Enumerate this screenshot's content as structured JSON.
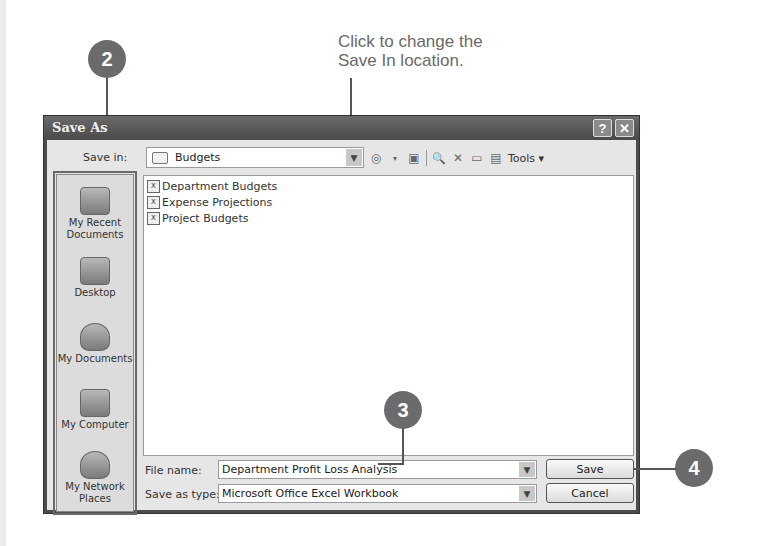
{
  "annotations": {
    "caption_line1": "Click to change the",
    "caption_line2": "Save In location.",
    "callouts": [
      "2",
      "3",
      "4"
    ]
  },
  "dialog": {
    "title": "Save As",
    "help_button": "?",
    "close_button": "✕",
    "save_in_label": "Save in:",
    "save_in_value": "Budgets",
    "toolbar": {
      "back_icon": "◎",
      "up_folder_icon": "▣",
      "search_web_icon": "🔍",
      "delete_icon": "✕",
      "new_folder_icon": "▭",
      "views_icon": "▤",
      "tools_label": "Tools ▾"
    },
    "places": [
      {
        "label_line1": "My Recent",
        "label_line2": "Documents"
      },
      {
        "label_line1": "Desktop",
        "label_line2": ""
      },
      {
        "label_line1": "My Documents",
        "label_line2": ""
      },
      {
        "label_line1": "My Computer",
        "label_line2": ""
      },
      {
        "label_line1": "My Network",
        "label_line2": "Places"
      }
    ],
    "files": [
      {
        "name": "Department Budgets",
        "icon": "xls"
      },
      {
        "name": "Expense Projections",
        "icon": "xls"
      },
      {
        "name": "Project Budgets",
        "icon": "xls"
      }
    ],
    "file_name_label": "File name:",
    "file_name_value": "Department Profit Loss Analysis",
    "save_as_type_label": "Save as type:",
    "save_as_type_value": "Microsoft Office Excel Workbook",
    "save_button": "Save",
    "cancel_button": "Cancel",
    "dropdown_arrow": "▼"
  }
}
